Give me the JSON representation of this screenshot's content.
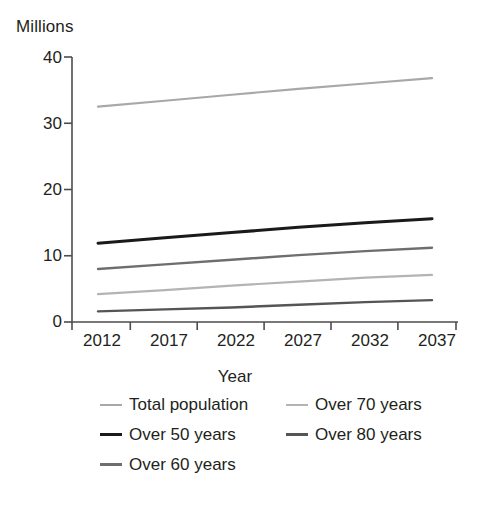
{
  "chart_data": {
    "type": "line",
    "title": "",
    "ylabel": "Millions",
    "xlabel": "Year",
    "x": [
      2012,
      2017,
      2022,
      2027,
      2032,
      2037
    ],
    "xlim": [
      2012,
      2040
    ],
    "ylim": [
      0,
      40
    ],
    "yticks": [
      0,
      10,
      20,
      30,
      40
    ],
    "ytick_labels": [
      "0",
      "10",
      "20",
      "30",
      "40"
    ],
    "xtick_labels": [
      "2012",
      "2017",
      "2022",
      "2027",
      "2032",
      "2037"
    ],
    "grid": false,
    "legend_position": "bottom",
    "series": [
      {
        "name": "Total population",
        "color": "#a8a8a8",
        "values": [
          32.5,
          33.4,
          34.3,
          35.2,
          36.0,
          36.8
        ]
      },
      {
        "name": "Over 50 years",
        "color": "#1a1a1a",
        "values": [
          11.9,
          12.7,
          13.5,
          14.3,
          15.0,
          15.6
        ]
      },
      {
        "name": "Over 60 years",
        "color": "#6e6e6e",
        "values": [
          8.0,
          8.7,
          9.4,
          10.1,
          10.7,
          11.2
        ]
      },
      {
        "name": "Over 70 years",
        "color": "#b4b4b4",
        "values": [
          4.2,
          4.8,
          5.5,
          6.1,
          6.7,
          7.1
        ]
      },
      {
        "name": "Over 80 years",
        "color": "#555555",
        "values": [
          1.6,
          1.9,
          2.2,
          2.6,
          3.0,
          3.3
        ]
      }
    ],
    "legend_entries": [
      {
        "label": "Total population",
        "color": "#a8a8a8",
        "thickness": 2
      },
      {
        "label": "Over 70 years",
        "color": "#b4b4b4",
        "thickness": 2
      },
      {
        "label": "Over 50 years",
        "color": "#1a1a1a",
        "thickness": 3
      },
      {
        "label": "Over 80 years",
        "color": "#555555",
        "thickness": 3
      },
      {
        "label": "Over 60 years",
        "color": "#6e6e6e",
        "thickness": 3
      }
    ]
  },
  "axes": {
    "y_title": "Millions",
    "x_title": "Year",
    "y_ticks": [
      "40",
      "30",
      "20",
      "10",
      "0"
    ],
    "x_ticks": [
      "2012",
      "2017",
      "2022",
      "2027",
      "2032",
      "2037"
    ]
  },
  "legend": {
    "row0": {
      "left": "Total population",
      "right": "Over 70 years"
    },
    "row1": {
      "left": "Over 50 years",
      "right": "Over 80 years"
    },
    "row2": {
      "left": "Over 60 years",
      "right": ""
    }
  },
  "colors": {
    "axis": "#4d4d4d",
    "text": "#231f20",
    "background": "#ffffff"
  }
}
